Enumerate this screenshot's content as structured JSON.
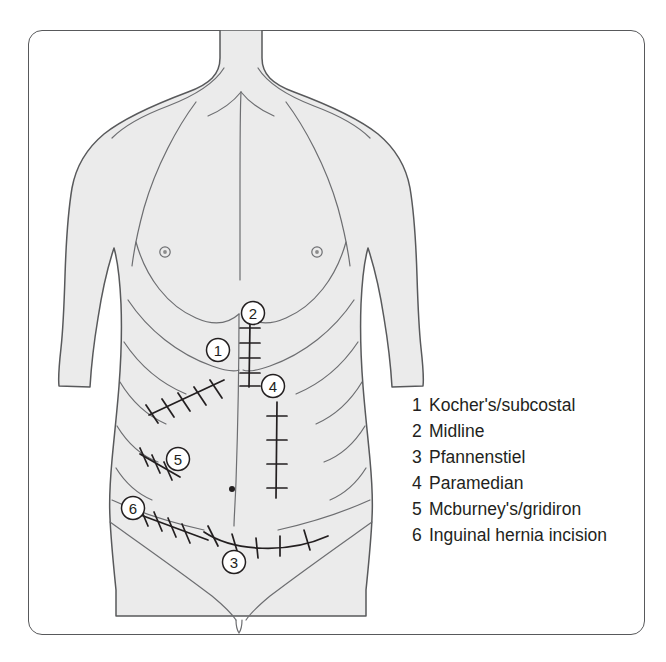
{
  "diagram": {
    "figure": {
      "subject": "anterior male torso",
      "skin_fill": "#ebebeb",
      "outline_color": "#58595b",
      "detail_color": "#6d6e71"
    },
    "frame": {
      "border_color": "#58595b",
      "background": "#ffffff"
    }
  },
  "markers": [
    {
      "id": "1",
      "label": "1",
      "x": 218,
      "y": 350
    },
    {
      "id": "2",
      "label": "2",
      "x": 253,
      "y": 313
    },
    {
      "id": "3",
      "label": "3",
      "x": 234,
      "y": 562
    },
    {
      "id": "4",
      "label": "4",
      "x": 273,
      "y": 386
    },
    {
      "id": "5",
      "label": "5",
      "x": 178,
      "y": 459
    },
    {
      "id": "6",
      "label": "6",
      "x": 133,
      "y": 508
    }
  ],
  "legend": {
    "items": [
      {
        "number": "1",
        "label": "Kocher's/subcostal"
      },
      {
        "number": "2",
        "label": "Midline"
      },
      {
        "number": "3",
        "label": "Pfannenstiel"
      },
      {
        "number": "4",
        "label": "Paramedian"
      },
      {
        "number": "5",
        "label": "Mcburney's/gridiron"
      },
      {
        "number": "6",
        "label": "Inguinal hernia incision"
      }
    ]
  }
}
